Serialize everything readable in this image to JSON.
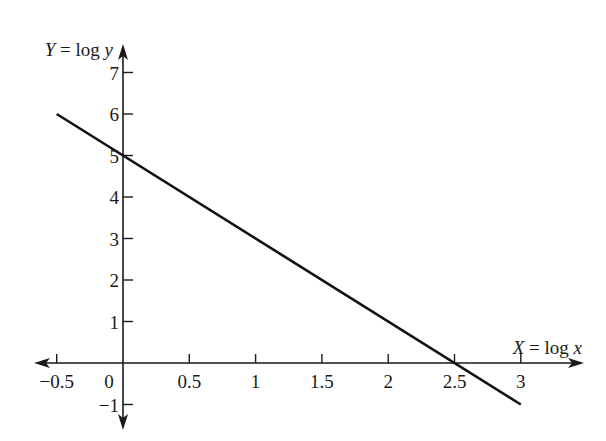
{
  "chart_data": {
    "type": "line",
    "title": "",
    "xlabel": "X = log x",
    "ylabel": "Y = log y",
    "xlabel_parts": {
      "var": "X",
      "eq": " = log ",
      "arg": "x"
    },
    "ylabel_parts": {
      "var": "Y",
      "eq": " = log ",
      "arg": "y"
    },
    "x_ticks": [
      -0.5,
      0.5,
      1,
      1.5,
      2,
      2.5,
      3
    ],
    "x_tick_labels": [
      "−0.5",
      "0.5",
      "1",
      "1.5",
      "2",
      "2.5",
      "3"
    ],
    "origin_label": "0",
    "y_ticks": [
      -1,
      1,
      2,
      3,
      4,
      5,
      6,
      7
    ],
    "y_tick_labels": [
      "−1",
      "1",
      "2",
      "3",
      "4",
      "5",
      "6",
      "7"
    ],
    "xlim": [
      -0.5,
      3.4
    ],
    "ylim": [
      -1.4,
      7.7
    ],
    "grid": false,
    "legend": null,
    "series": [
      {
        "name": "Y = 5 - 2X",
        "x": [
          -0.5,
          3
        ],
        "y": [
          6,
          -1
        ],
        "slope": -2,
        "intercept": 5
      }
    ]
  },
  "colors": {
    "axis": "#1a1a1a",
    "line": "#111111",
    "background": "#ffffff"
  }
}
